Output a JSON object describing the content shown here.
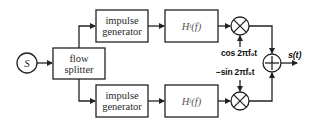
{
  "diagram": {
    "source": {
      "label": "S"
    },
    "splitter": {
      "line1": "flow",
      "line2": "splitter"
    },
    "upper_branch": {
      "generator": {
        "line1": "impulse",
        "line2": "generator"
      },
      "filter": {
        "label": "H",
        "subscript": "i",
        "arg": "(f)"
      },
      "carrier": "cos 2πf₀t",
      "mixer_symbol": "×"
    },
    "lower_branch": {
      "generator": {
        "line1": "impulse",
        "line2": "generator"
      },
      "filter": {
        "label": "H",
        "subscript": "i",
        "arg": "(f)"
      },
      "carrier": "−sin 2πf₀t",
      "mixer_symbol": "×"
    },
    "adder": {
      "symbol": "+"
    },
    "output": {
      "label": "s(t)"
    }
  },
  "colors": {
    "stroke": "#222222",
    "background": "#ffffff"
  }
}
